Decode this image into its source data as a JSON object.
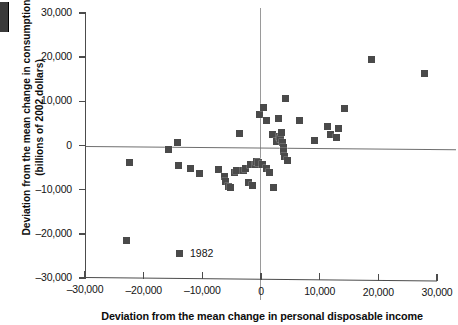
{
  "chart_data": {
    "type": "scatter",
    "title": "",
    "xlabel": "Deviation from the mean change in personal disposable income",
    "ylabel": "Deviation from the mean change in consumption (billions of 2002 dollars)",
    "ylabel_line1": "Deviation from the mean change in consumption",
    "ylabel_line2": "(billions of 2002 dollars)",
    "xlim": [
      -30000,
      30000
    ],
    "ylim": [
      -30000,
      30000
    ],
    "xticks": [
      -30000,
      -20000,
      -10000,
      0,
      10000,
      20000,
      30000
    ],
    "yticks": [
      -30000,
      -20000,
      -10000,
      0,
      10000,
      20000,
      30000
    ],
    "xticklabels": [
      "–30,000",
      "–20,000",
      "–10,000",
      "0",
      "10,000",
      "20,000",
      "30,000"
    ],
    "yticklabels": [
      "30,000",
      "20,000",
      "10,000",
      "0",
      "–10,000",
      "–20,000",
      "–30,000"
    ],
    "grid": false,
    "zero_lines": true,
    "marker": "square",
    "marker_color": "#4a4a4a",
    "legend": {
      "position": "inside-bottom-left",
      "entries": [
        {
          "label": "1982",
          "marker": "square",
          "color": "#4a4a4a"
        }
      ]
    },
    "points": [
      {
        "x": -23000,
        "y": -21500,
        "label": "1982"
      },
      {
        "x": -22500,
        "y": -3800
      },
      {
        "x": -15800,
        "y": -900
      },
      {
        "x": -14200,
        "y": 600
      },
      {
        "x": -14000,
        "y": -4600
      },
      {
        "x": -12000,
        "y": -5200
      },
      {
        "x": -10400,
        "y": -6400
      },
      {
        "x": -7200,
        "y": -5400
      },
      {
        "x": -6300,
        "y": -7100
      },
      {
        "x": -6000,
        "y": -8200
      },
      {
        "x": -5600,
        "y": -9200
      },
      {
        "x": -5200,
        "y": -9600
      },
      {
        "x": -4600,
        "y": -6000
      },
      {
        "x": -4200,
        "y": -5700
      },
      {
        "x": -3600,
        "y": 2700
      },
      {
        "x": -3000,
        "y": -5600
      },
      {
        "x": -2600,
        "y": -5300
      },
      {
        "x": -2200,
        "y": -8400
      },
      {
        "x": -1800,
        "y": -4400
      },
      {
        "x": -1500,
        "y": -9000
      },
      {
        "x": -1000,
        "y": -4200
      },
      {
        "x": -700,
        "y": -3600
      },
      {
        "x": -400,
        "y": -3900
      },
      {
        "x": -200,
        "y": 7100
      },
      {
        "x": 200,
        "y": -4300
      },
      {
        "x": 500,
        "y": 8600
      },
      {
        "x": 900,
        "y": -5200
      },
      {
        "x": 1000,
        "y": 5600
      },
      {
        "x": 1500,
        "y": -6200
      },
      {
        "x": 1900,
        "y": 2600
      },
      {
        "x": 2200,
        "y": -9600
      },
      {
        "x": 2600,
        "y": 900
      },
      {
        "x": 2900,
        "y": 6100
      },
      {
        "x": 3200,
        "y": 2100
      },
      {
        "x": 3400,
        "y": 1500
      },
      {
        "x": 3500,
        "y": 3000
      },
      {
        "x": 3700,
        "y": 700
      },
      {
        "x": 3800,
        "y": -400
      },
      {
        "x": 3900,
        "y": -1400
      },
      {
        "x": 4000,
        "y": -2500
      },
      {
        "x": 4200,
        "y": 10700
      },
      {
        "x": 4600,
        "y": -3400
      },
      {
        "x": 6600,
        "y": 5600
      },
      {
        "x": 9200,
        "y": 1100
      },
      {
        "x": 11400,
        "y": 4400
      },
      {
        "x": 11800,
        "y": 2600
      },
      {
        "x": 12800,
        "y": 1900
      },
      {
        "x": 13200,
        "y": 3900
      },
      {
        "x": 14200,
        "y": 8300
      },
      {
        "x": 18900,
        "y": 19400
      },
      {
        "x": 27800,
        "y": 16300
      }
    ]
  },
  "legend": {
    "item_1982": "1982"
  },
  "axes": {
    "x_title": "Deviation from the mean change in personal disposable income",
    "y_title_line1": "Deviation from the mean change in consumption",
    "y_title_line2": "(billions of 2002 dollars)"
  }
}
